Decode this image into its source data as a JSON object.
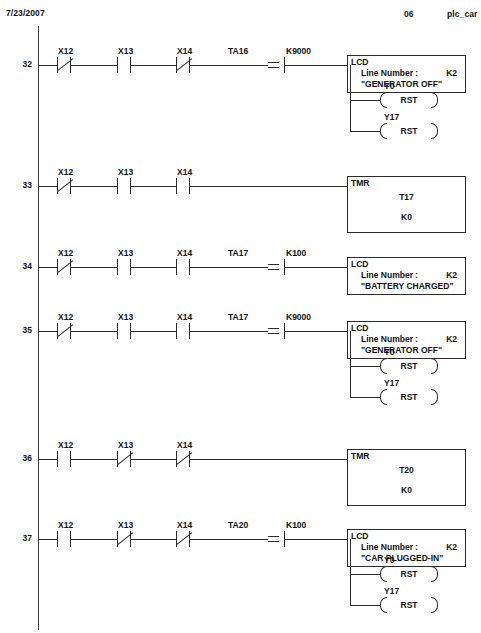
{
  "header": {
    "date": "7/23/2007",
    "page": "06",
    "project": "plc_car"
  },
  "labels": {
    "equal_symbol": "=",
    "lcd_title": "LCD",
    "tmr_title": "TMR",
    "line_number_label": "Line Number :",
    "rst_label": "RST"
  },
  "rungs": [
    {
      "number": "32",
      "contacts": [
        {
          "label": "X12",
          "type": "nc"
        },
        {
          "label": "X13",
          "type": "no"
        },
        {
          "label": "X14",
          "type": "nc"
        }
      ],
      "compare": {
        "operand_left": "TA16",
        "operator": "=",
        "operand_right": "K9000"
      },
      "output": {
        "kind": "lcd",
        "title": "LCD",
        "line_number_label": "Line Number :",
        "k_value": "K2",
        "message": "\"GENERATOR OFF\""
      },
      "coils": [
        {
          "label": "Y0",
          "op": "RST"
        },
        {
          "label": "Y17",
          "op": "RST"
        }
      ]
    },
    {
      "number": "33",
      "contacts": [
        {
          "label": "X12",
          "type": "nc"
        },
        {
          "label": "X13",
          "type": "no"
        },
        {
          "label": "X14",
          "type": "no"
        }
      ],
      "compare": null,
      "output": {
        "kind": "tmr",
        "title": "TMR",
        "timer": "T17",
        "preset": "K0"
      },
      "coils": []
    },
    {
      "number": "34",
      "contacts": [
        {
          "label": "X12",
          "type": "nc"
        },
        {
          "label": "X13",
          "type": "no"
        },
        {
          "label": "X14",
          "type": "no"
        }
      ],
      "compare": {
        "operand_left": "TA17",
        "operator": "=",
        "operand_right": "K100"
      },
      "output": {
        "kind": "lcd",
        "title": "LCD",
        "line_number_label": "Line Number :",
        "k_value": "K2",
        "message": "\"BATTERY CHARGED\""
      },
      "coils": []
    },
    {
      "number": "35",
      "contacts": [
        {
          "label": "X12",
          "type": "nc"
        },
        {
          "label": "X13",
          "type": "no"
        },
        {
          "label": "X14",
          "type": "no"
        }
      ],
      "compare": {
        "operand_left": "TA17",
        "operator": "=",
        "operand_right": "K9000"
      },
      "output": {
        "kind": "lcd",
        "title": "LCD",
        "line_number_label": "Line Number :",
        "k_value": "K2",
        "message": "\"GENERATOR OFF\""
      },
      "coils": [
        {
          "label": "Y0",
          "op": "RST"
        },
        {
          "label": "Y17",
          "op": "RST"
        }
      ]
    },
    {
      "number": "36",
      "contacts": [
        {
          "label": "X12",
          "type": "no"
        },
        {
          "label": "X13",
          "type": "nc"
        },
        {
          "label": "X14",
          "type": "nc"
        }
      ],
      "compare": null,
      "output": {
        "kind": "tmr",
        "title": "TMR",
        "timer": "T20",
        "preset": "K0"
      },
      "coils": []
    },
    {
      "number": "37",
      "contacts": [
        {
          "label": "X12",
          "type": "no"
        },
        {
          "label": "X13",
          "type": "nc"
        },
        {
          "label": "X14",
          "type": "nc"
        }
      ],
      "compare": {
        "operand_left": "TA20",
        "operator": "=",
        "operand_right": "K100"
      },
      "output": {
        "kind": "lcd",
        "title": "LCD",
        "line_number_label": "Line Number :",
        "k_value": "K2",
        "message": "\"CAR PLUGGED-IN\""
      },
      "coils": [
        {
          "label": "Y0",
          "op": "RST"
        },
        {
          "label": "Y17",
          "op": "RST"
        }
      ]
    }
  ]
}
